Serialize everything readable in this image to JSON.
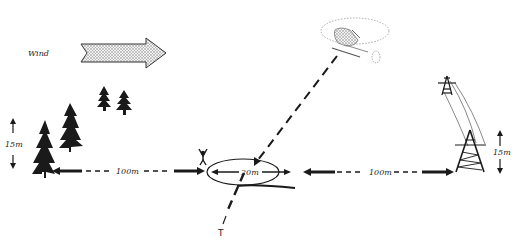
{
  "diagram": {
    "wind_label": "Wind",
    "tree_height_label": "15m",
    "left_distance_label": "100m",
    "zone_diameter_label": "20m",
    "right_distance_label": "100m",
    "pylon_height_label": "15m",
    "touchdown_marker_label": "T"
  },
  "colors": {
    "ink": "#1a1a1a",
    "arrow_fill": "#d8d8d8",
    "background": "#ffffff"
  }
}
